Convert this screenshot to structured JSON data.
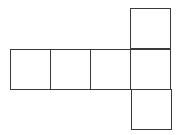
{
  "diagram": {
    "type": "cube-net",
    "stroke_color": "#3a3a3a",
    "background_color": "#ffffff",
    "square_size": 40,
    "squares": [
      {
        "id": "row-1",
        "x": 10,
        "y": 49
      },
      {
        "id": "row-2",
        "x": 50,
        "y": 49
      },
      {
        "id": "row-3",
        "x": 90,
        "y": 49
      },
      {
        "id": "row-4",
        "x": 130,
        "y": 49
      },
      {
        "id": "top",
        "x": 130,
        "y": 8
      },
      {
        "id": "bottom",
        "x": 130,
        "y": 89
      }
    ]
  }
}
